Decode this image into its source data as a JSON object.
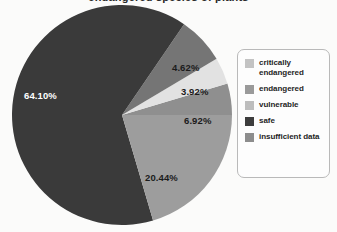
{
  "chart_data": {
    "type": "pie",
    "title": "",
    "xlabel": "",
    "ylabel": "",
    "grid": false,
    "legend_position": "right",
    "categories": [
      "critically endangered",
      "endangered",
      "vulnerable",
      "safe",
      "insufficient data"
    ],
    "values": [
      4.62,
      3.92,
      6.92,
      64.1,
      20.44
    ],
    "value_labels": [
      "4.62%",
      "3.92%",
      "6.92%",
      "64.10%",
      "20.44%"
    ],
    "units": "percent",
    "colors": [
      "#8f8f8f",
      "#e2e2e2",
      "#757575",
      "#3a3a3a",
      "#9d9d9d"
    ]
  },
  "figure": {
    "background_color": "#fbfbfa",
    "title": "endangered species of plants"
  },
  "pie": {
    "labels": [
      {
        "text": "4.62%",
        "tone": "dark-text",
        "left": "160px",
        "top": "60px"
      },
      {
        "text": "3.92%",
        "tone": "dark-text",
        "left": "169px",
        "top": "84px"
      },
      {
        "text": "6.92%",
        "tone": "dark-text",
        "left": "172px",
        "top": "113px"
      },
      {
        "text": "20.44%",
        "tone": "dark-text",
        "left": "133px",
        "top": "170px"
      },
      {
        "text": "64.10%",
        "tone": "light-text",
        "left": "12px",
        "top": "88px"
      }
    ]
  },
  "legend": {
    "items": [
      {
        "label": "critically endangered",
        "color": "#c3c3c3"
      },
      {
        "label": "endangered",
        "color": "#9a9a9a"
      },
      {
        "label": "vulnerable",
        "color": "#bdbdbd"
      },
      {
        "label": "safe",
        "color": "#3d3d3d"
      },
      {
        "label": "insufficient data",
        "color": "#8d8d8d"
      }
    ]
  }
}
